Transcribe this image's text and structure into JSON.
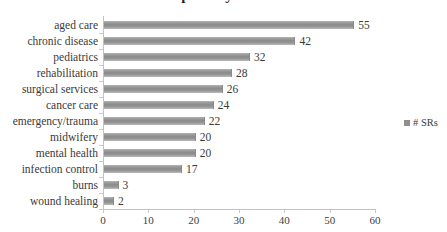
{
  "chart_data": {
    "type": "bar",
    "orientation": "horizontal",
    "title": "Specialty Areas",
    "xlabel": "",
    "ylabel": "",
    "xlim": [
      0,
      60
    ],
    "xticks": [
      0,
      10,
      20,
      30,
      40,
      50,
      60
    ],
    "grid": false,
    "legend_position": "right",
    "categories": [
      "aged care",
      "chronic disease",
      "pediatrics",
      "rehabilitation",
      "surgical services",
      "cancer care",
      "emergency/trauma",
      "midwifery",
      "mental health",
      "infection control",
      "burns",
      "wound healing"
    ],
    "series": [
      {
        "name": "# SRs",
        "color": "#8f8f8f",
        "values": [
          55,
          42,
          32,
          28,
          26,
          24,
          22,
          20,
          20,
          17,
          3,
          2
        ]
      }
    ],
    "data_labels": [
      "55",
      "42",
      "32",
      "28",
      "26",
      "24",
      "22",
      "20",
      "20",
      "17",
      "3",
      "2"
    ],
    "xtick_labels": [
      "0",
      "10",
      "20",
      "30",
      "40",
      "50",
      "60"
    ]
  },
  "legend": {
    "entries": [
      {
        "label": "# SRs",
        "color": "#8f8f8f"
      }
    ]
  },
  "colors": {
    "bar": "#8f8f8f",
    "axis": "#c2c2c2",
    "text": "#3a3a3a",
    "title": "#262626",
    "background": "#ffffff"
  }
}
